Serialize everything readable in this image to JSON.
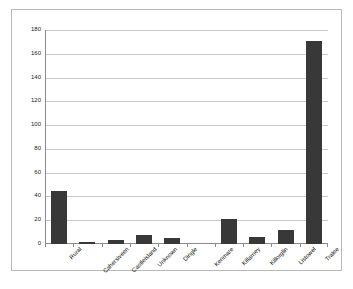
{
  "chart_data": {
    "type": "bar",
    "title": "",
    "subtitle": "",
    "xlabel": "",
    "ylabel": "",
    "ylim": [
      0,
      180
    ],
    "ytick_step": 20,
    "yticks": [
      180,
      160,
      140,
      120,
      100,
      80,
      60,
      40,
      20,
      0
    ],
    "grid": "horizontal",
    "legend": "none",
    "bar_color": "#383838",
    "plot_background": "#ffffff",
    "gridline_color": "#c8c8c8",
    "axis_color": "#8c8c8c",
    "frame_color": "#b9b9b9",
    "categories": [
      "Rural",
      "Cahersiveen",
      "Castleisland",
      "Unknown",
      "Dingle",
      "Kenmare",
      "Killarney",
      "Killorglin",
      "Listowel",
      "Tralee"
    ],
    "values": [
      45,
      2,
      3,
      8,
      5,
      0,
      21,
      6,
      12,
      171
    ]
  }
}
